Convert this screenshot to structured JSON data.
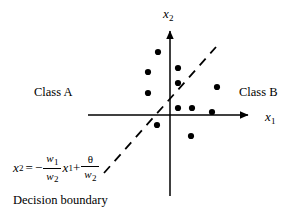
{
  "figure": {
    "title_caption": "Decision boundary",
    "background_color": "#ffffff",
    "ink_color": "#000000"
  },
  "axes": {
    "x_axis": {
      "label_base": "x",
      "label_sub": "1",
      "icon": "arrow-right-icon",
      "x_start": 88,
      "x_end": 252,
      "y": 115
    },
    "y_axis": {
      "label_base": "x",
      "label_sub": "2",
      "icon": "arrow-up-icon",
      "x": 170,
      "y_start": 26,
      "y_end": 196
    }
  },
  "class_labels": {
    "left": "Class A",
    "right": "Class B"
  },
  "decision_boundary": {
    "style": "dashed",
    "x1": 104,
    "y1": 173,
    "x2": 216,
    "y2": 47,
    "dash_pattern": "9 7",
    "stroke_width": 1.8
  },
  "equation": {
    "lhs_base": "x",
    "lhs_sub": "2",
    "equals": "=",
    "minus": "−",
    "frac1_num_base": "w",
    "frac1_num_sub": "1",
    "frac1_den_base": "w",
    "frac1_den_sub": "2",
    "var_base": "x",
    "var_sub": "1",
    "plus": "+",
    "frac2_num": "θ",
    "frac2_den_base": "w",
    "frac2_den_sub": "2"
  },
  "chart_data": {
    "type": "scatter",
    "title": "Decision boundary",
    "xlabel": "x1",
    "ylabel": "x2",
    "grid": false,
    "legend": [
      "Class A",
      "Class B"
    ],
    "annotations": [
      "x2 = -(w1/w2) x1 + theta/w2",
      "Decision boundary"
    ],
    "origin_px": [
      170,
      115
    ],
    "points_px": [
      [
        158,
        52
      ],
      [
        148,
        72
      ],
      [
        148,
        93
      ],
      [
        157,
        125
      ],
      [
        178,
        68
      ],
      [
        178,
        83
      ],
      [
        178,
        108
      ],
      [
        192,
        108
      ],
      [
        217,
        87
      ],
      [
        212,
        112
      ],
      [
        191,
        136
      ]
    ],
    "series": [
      {
        "name": "Class A",
        "marker": "filled-circle",
        "color": "#000000",
        "points": [
          [
            -12,
            63
          ],
          [
            -22,
            43
          ],
          [
            -22,
            22
          ],
          [
            -13,
            -10
          ]
        ]
      },
      {
        "name": "Class B",
        "marker": "filled-circle",
        "color": "#000000",
        "points": [
          [
            8,
            47
          ],
          [
            8,
            32
          ],
          [
            8,
            7
          ],
          [
            22,
            7
          ],
          [
            47,
            28
          ],
          [
            42,
            3
          ],
          [
            21,
            -21
          ]
        ]
      }
    ]
  }
}
